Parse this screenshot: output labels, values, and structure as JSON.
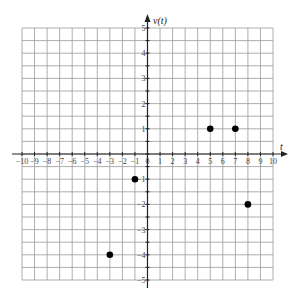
{
  "chart_data": {
    "type": "scatter",
    "title": "",
    "xlabel": "t",
    "ylabel": "v(t)",
    "xlim": [
      -10,
      10
    ],
    "ylim": [
      -5,
      5
    ],
    "grid": true,
    "grid_x_step": 1,
    "grid_y_step": 0.5,
    "x_ticks": [
      -10,
      -9,
      -8,
      -7,
      -6,
      -5,
      -4,
      -3,
      -2,
      -1,
      0,
      1,
      2,
      3,
      4,
      5,
      6,
      7,
      8,
      9,
      10
    ],
    "y_ticks": [
      -5,
      -4,
      -3,
      -2,
      -1,
      1,
      2,
      3,
      4,
      5
    ],
    "points": [
      {
        "x": -3,
        "y": -4
      },
      {
        "x": -1,
        "y": -1
      },
      {
        "x": 5,
        "y": 1
      },
      {
        "x": 7,
        "y": 1
      },
      {
        "x": 8,
        "y": -2
      }
    ],
    "marker_color": "#000000",
    "grid_color": "#999999",
    "axis_color": "#222222"
  }
}
